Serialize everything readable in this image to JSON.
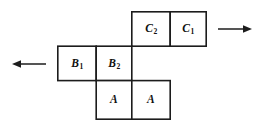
{
  "diagram": {
    "background_color": "#ffffff",
    "line_color": "#1c1c1c",
    "label_color": "#111111",
    "cells": [
      {
        "id": "c2",
        "name": "cell-c2",
        "base": "C",
        "subscript": "2",
        "label": "C2",
        "row": "top",
        "x": 131,
        "y": 11,
        "w": 39,
        "h": 35
      },
      {
        "id": "c1",
        "name": "cell-c1",
        "base": "C",
        "subscript": "1",
        "label": "C1",
        "row": "top",
        "x": 170,
        "y": 11,
        "w": 37,
        "h": 35
      },
      {
        "id": "b1",
        "name": "cell-b1",
        "base": "B",
        "subscript": "1",
        "label": "B1",
        "row": "middle",
        "x": 57,
        "y": 46,
        "w": 39,
        "h": 35
      },
      {
        "id": "b2",
        "name": "cell-b2",
        "base": "B",
        "subscript": "2",
        "label": "B2",
        "row": "middle",
        "x": 96,
        "y": 46,
        "w": 35,
        "h": 35
      },
      {
        "id": "a-left",
        "name": "cell-a-left",
        "base": "A",
        "subscript": "",
        "label": "A",
        "row": "bottom",
        "x": 96,
        "y": 81,
        "w": 35,
        "h": 39
      },
      {
        "id": "a-right",
        "name": "cell-a-right",
        "base": "A",
        "subscript": "",
        "label": "A",
        "row": "bottom",
        "x": 131,
        "y": 81,
        "w": 39,
        "h": 39
      }
    ],
    "arrows": [
      {
        "id": "arrow-right",
        "name": "arrow-right",
        "direction": "right",
        "x1": 218,
        "y1": 29,
        "x2": 250,
        "y2": 29
      },
      {
        "id": "arrow-left",
        "name": "arrow-left",
        "direction": "left",
        "x1": 46,
        "y1": 64,
        "x2": 14,
        "y2": 64
      }
    ]
  }
}
